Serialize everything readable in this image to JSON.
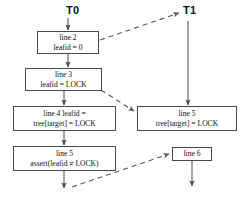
{
  "diagram": {
    "threads": [
      {
        "id": "T0",
        "label": "T0",
        "x": 73,
        "y": 5
      },
      {
        "id": "T1",
        "label": "T1",
        "x": 186,
        "y": 5
      }
    ],
    "nodes": [
      {
        "id": "n-line2",
        "line1": "line 2",
        "line2": "leafid = 0",
        "x": 37,
        "y": 31,
        "w": 62,
        "h": 23
      },
      {
        "id": "n-line3",
        "line1": "line 3",
        "line2": "leafid = LOCK",
        "x": 25,
        "y": 68,
        "w": 77,
        "h": 23
      },
      {
        "id": "n-line4",
        "line1": "line 4 leafid =",
        "line2": "tree[target] = LOCK",
        "x": 13,
        "y": 106,
        "w": 103,
        "h": 25
      },
      {
        "id": "n-line5-left",
        "line1": "line 5",
        "line2": "assert(leafid ≠ LOCK)",
        "x": 13,
        "y": 146,
        "w": 103,
        "h": 25
      },
      {
        "id": "n-line5-right",
        "line1": "line 5",
        "line2": "tree[target] = LOCK",
        "x": 137,
        "y": 106,
        "w": 100,
        "h": 25
      },
      {
        "id": "n-line6",
        "line1": "line 6",
        "line2": "",
        "x": 172,
        "y": 147,
        "w": 40,
        "h": 14
      }
    ],
    "colors": {
      "stroke": "#4a4a4a",
      "text": "#111111",
      "background": "#ffffff"
    },
    "edge_styles": {
      "solid": "solid-arrow",
      "dashed": "dashed-arrow"
    }
  }
}
